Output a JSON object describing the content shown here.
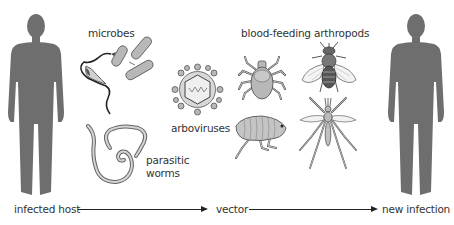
{
  "diagram": {
    "type": "transmission-cycle",
    "colors": {
      "silhouette": "#6e6e6e",
      "illustration_fill": "#b8b8b8",
      "outline": "#444444",
      "text": "#333333",
      "arrow": "#222222"
    },
    "nodes": {
      "infected_host": {
        "label": "infected host"
      },
      "vector": {
        "label": "vector"
      },
      "new_infection": {
        "label": "new infection"
      }
    },
    "groups": {
      "microbes": {
        "label": "microbes"
      },
      "arboviruses": {
        "label": "arboviruses"
      },
      "parasitic_worms": {
        "label_line1": "parasitic",
        "label_line2": "worms"
      },
      "arthropods": {
        "label": "blood-feeding arthropods"
      }
    },
    "illustrations": [
      "human-silhouette-left",
      "trypanosome",
      "rod-bacteria",
      "arbovirus-particle",
      "parasitic-worms",
      "tick",
      "fly",
      "flea",
      "mosquito",
      "human-silhouette-right"
    ],
    "edges": [
      {
        "from": "infected host",
        "to": "vector"
      },
      {
        "from": "vector",
        "to": "new infection"
      }
    ]
  }
}
